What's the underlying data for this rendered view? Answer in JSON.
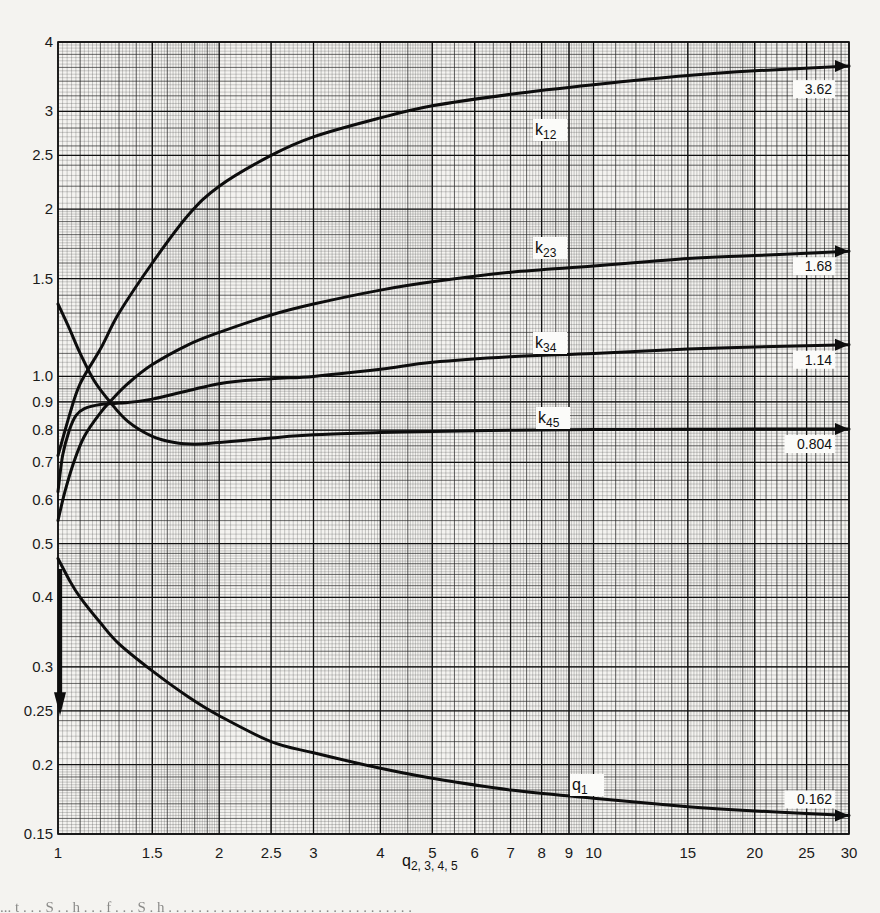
{
  "chart_data": {
    "type": "line",
    "title": "",
    "xlabel": "q_{2,3,4,5}",
    "ylabel": "",
    "xscale": "log",
    "yscale": "log",
    "xlim": [
      1,
      30
    ],
    "ylim": [
      0.15,
      4
    ],
    "grid": true,
    "legend": "inline curve labels",
    "x_ticks": [
      1,
      1.5,
      2,
      2.5,
      3,
      4,
      5,
      6,
      7,
      8,
      9,
      10,
      15,
      20,
      25,
      30
    ],
    "x_tick_labels": [
      "1",
      "1.5",
      "2",
      "2.5",
      "3",
      "4",
      "5",
      "6",
      "7",
      "8",
      "9",
      "10",
      "15",
      "20",
      "25",
      "30"
    ],
    "y_ticks": [
      0.15,
      0.2,
      0.25,
      0.3,
      0.4,
      0.5,
      0.6,
      0.7,
      0.8,
      0.9,
      1.0,
      1.5,
      2,
      2.5,
      3,
      4
    ],
    "y_tick_labels": [
      "0.15",
      "0.2",
      "0.25",
      "0.3",
      "0.4",
      "0.5",
      "0.6",
      "0.7",
      "0.8",
      "0.9",
      "1.0",
      "1.5",
      "2",
      "2.5",
      "3",
      "4"
    ],
    "series": [
      {
        "name": "k12",
        "label_main": "k",
        "label_sub": "12",
        "asymptote": "3.62",
        "x": [
          1,
          1.05,
          1.1,
          1.2,
          1.3,
          1.5,
          1.75,
          2,
          2.5,
          3,
          4,
          5,
          7,
          10,
          15,
          20,
          30
        ],
        "y": [
          0.72,
          0.85,
          0.97,
          1.12,
          1.3,
          1.6,
          1.95,
          2.2,
          2.5,
          2.7,
          2.92,
          3.07,
          3.22,
          3.35,
          3.48,
          3.55,
          3.62
        ]
      },
      {
        "name": "k23",
        "label_main": "k",
        "label_sub": "23",
        "asymptote": "1.68",
        "x": [
          1,
          1.03,
          1.07,
          1.12,
          1.2,
          1.25,
          1.35,
          1.5,
          1.75,
          2,
          2.5,
          3,
          4,
          5,
          7,
          10,
          15,
          20,
          30
        ],
        "y": [
          0.55,
          0.62,
          0.7,
          0.78,
          0.86,
          0.9,
          0.97,
          1.05,
          1.14,
          1.2,
          1.29,
          1.35,
          1.43,
          1.48,
          1.54,
          1.58,
          1.63,
          1.65,
          1.68
        ]
      },
      {
        "name": "k34",
        "label_main": "k",
        "label_sub": "34",
        "asymptote": "1.14",
        "x": [
          1,
          1.02,
          1.05,
          1.08,
          1.12,
          1.2,
          1.3,
          1.5,
          2,
          2.5,
          3,
          4,
          5,
          7,
          10,
          15,
          20,
          30
        ],
        "y": [
          0.62,
          0.72,
          0.8,
          0.85,
          0.875,
          0.89,
          0.895,
          0.91,
          0.97,
          0.99,
          1.0,
          1.03,
          1.06,
          1.085,
          1.1,
          1.12,
          1.13,
          1.14
        ]
      },
      {
        "name": "k45",
        "label_main": "k",
        "label_sub": "45",
        "asymptote": "0.804",
        "x": [
          1,
          1.05,
          1.1,
          1.17,
          1.25,
          1.35,
          1.5,
          1.65,
          1.8,
          2,
          2.5,
          3,
          4,
          5,
          7,
          10,
          15,
          20,
          30
        ],
        "y": [
          1.35,
          1.22,
          1.1,
          0.98,
          0.9,
          0.83,
          0.78,
          0.76,
          0.755,
          0.76,
          0.775,
          0.785,
          0.792,
          0.796,
          0.8,
          0.802,
          0.803,
          0.804,
          0.804
        ]
      },
      {
        "name": "q1",
        "label_main": "q",
        "label_sub": "1",
        "asymptote": "0.162",
        "x": [
          1,
          1.05,
          1.1,
          1.2,
          1.3,
          1.5,
          1.75,
          2,
          2.5,
          3,
          4,
          5,
          7,
          10,
          15,
          20,
          30
        ],
        "y": [
          0.47,
          0.43,
          0.4,
          0.36,
          0.33,
          0.295,
          0.265,
          0.245,
          0.22,
          0.21,
          0.197,
          0.189,
          0.18,
          0.174,
          0.168,
          0.165,
          0.162
        ]
      }
    ],
    "annotations": [
      {
        "text": "0.25",
        "note": "downward arrow at x=1 marking 0.25 on y-axis"
      }
    ]
  },
  "axis_title": {
    "main": "q",
    "sub": "2, 3, 4, 5"
  },
  "caption_fragment": "... t   . . .  S . .  h  . .  . f  . . .  S . h . .  .  . . .  . . . . . . .  . . . . . . . . . . . . .  . . . . . . ."
}
